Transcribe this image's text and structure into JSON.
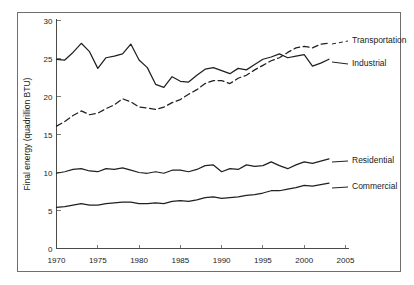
{
  "chart_data": {
    "type": "line",
    "title": "",
    "xlabel": "",
    "ylabel": "Final energy (quadrillion BTU)",
    "xlim": [
      1970,
      2005
    ],
    "ylim": [
      0,
      30
    ],
    "xticks": [
      1970,
      1975,
      1980,
      1985,
      1990,
      1995,
      2000,
      2005
    ],
    "yticks": [
      0,
      5,
      10,
      15,
      20,
      25,
      30
    ],
    "grid": false,
    "legend_position": "right-inline-labels",
    "x": [
      1970,
      1971,
      1972,
      1973,
      1974,
      1975,
      1976,
      1977,
      1978,
      1979,
      1980,
      1981,
      1982,
      1983,
      1984,
      1985,
      1986,
      1987,
      1988,
      1989,
      1990,
      1991,
      1992,
      1993,
      1994,
      1995,
      1996,
      1997,
      1998,
      1999,
      2000,
      2001,
      2002,
      2003
    ],
    "series": [
      {
        "name": "Transportation",
        "style": "dashed",
        "label": "Transportation",
        "values": [
          16.1,
          16.7,
          17.5,
          18.1,
          17.6,
          17.8,
          18.4,
          18.9,
          19.7,
          19.3,
          18.6,
          18.5,
          18.3,
          18.6,
          19.2,
          19.6,
          20.3,
          20.9,
          21.7,
          22.1,
          22.1,
          21.7,
          22.4,
          22.8,
          23.5,
          24.1,
          24.7,
          25.1,
          25.8,
          26.4,
          26.6,
          26.4,
          26.9,
          27.0
        ]
      },
      {
        "name": "Industrial",
        "style": "solid",
        "label": "Industrial",
        "values": [
          24.9,
          24.8,
          25.8,
          27.0,
          25.9,
          23.7,
          25.1,
          25.3,
          25.6,
          26.9,
          24.8,
          23.8,
          21.6,
          21.2,
          22.6,
          22.0,
          21.9,
          22.8,
          23.6,
          23.8,
          23.4,
          23.0,
          23.7,
          23.5,
          24.2,
          24.9,
          25.2,
          25.6,
          25.1,
          25.3,
          25.5,
          24.0,
          24.4,
          24.9
        ]
      },
      {
        "name": "Residential",
        "style": "solid",
        "label": "Residential",
        "values": [
          9.9,
          10.1,
          10.4,
          10.5,
          10.2,
          10.1,
          10.5,
          10.4,
          10.6,
          10.3,
          10.0,
          9.9,
          10.1,
          9.9,
          10.3,
          10.3,
          10.1,
          10.4,
          10.9,
          11.0,
          10.1,
          10.5,
          10.4,
          11.0,
          10.8,
          10.9,
          11.4,
          10.9,
          10.5,
          11.0,
          11.4,
          11.2,
          11.5,
          11.8
        ]
      },
      {
        "name": "Commercial",
        "style": "solid",
        "label": "Commercial",
        "values": [
          5.4,
          5.5,
          5.7,
          5.9,
          5.7,
          5.7,
          5.9,
          6.0,
          6.1,
          6.1,
          5.9,
          5.9,
          6.0,
          5.9,
          6.2,
          6.3,
          6.2,
          6.4,
          6.7,
          6.8,
          6.6,
          6.7,
          6.8,
          7.0,
          7.1,
          7.3,
          7.6,
          7.6,
          7.8,
          8.0,
          8.3,
          8.2,
          8.4,
          8.6
        ]
      }
    ]
  }
}
